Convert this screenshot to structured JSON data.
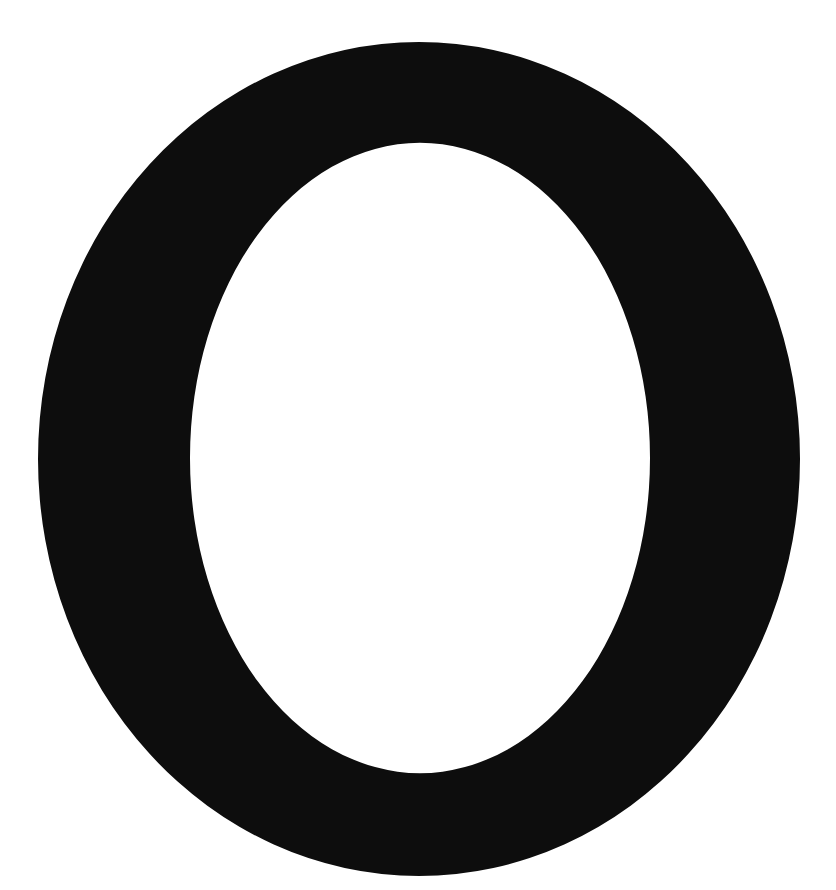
{
  "glyph": {
    "character": "O",
    "ink_color": "#0d0d0d",
    "background_color": "#ffffff",
    "outer": {
      "cx": 419,
      "cy": 459,
      "rx": 381,
      "ry": 417
    },
    "inner": {
      "cx": 420,
      "cy": 458,
      "rx": 230,
      "ry": 315
    }
  }
}
